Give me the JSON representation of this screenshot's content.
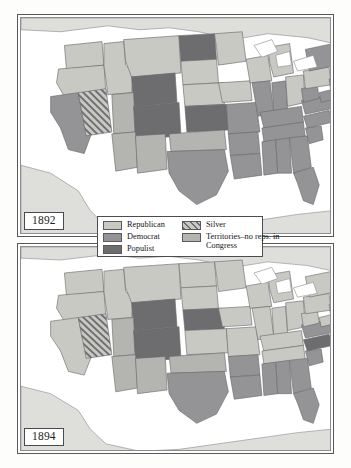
{
  "figure": {
    "kind": "two-panel-choropleth-map",
    "region": "United States"
  },
  "panels": [
    {
      "id": "panel-1892",
      "year_label": "1892"
    },
    {
      "id": "panel-1894",
      "year_label": "1894"
    }
  ],
  "legend": {
    "left_column": [
      {
        "key": "republican",
        "label": "Republican",
        "color": "#c9c9c4",
        "pattern": "solid"
      },
      {
        "key": "democrat",
        "label": "Democrat",
        "color": "#949497",
        "pattern": "solid"
      },
      {
        "key": "populist",
        "label": "Populist",
        "color": "#6d6d70",
        "pattern": "solid"
      }
    ],
    "right_column": [
      {
        "key": "silver",
        "label": "Silver",
        "color": "#c9c9c4",
        "pattern": "diagonal-hatch"
      },
      {
        "key": "territories",
        "label": "Territories–no reps. in Congress",
        "color": "#b4b4b0",
        "pattern": "solid"
      }
    ]
  },
  "colors": {
    "republican": "#c9c9c4",
    "democrat": "#949497",
    "populist": "#6d6d70",
    "silver_base": "#c9c9c4",
    "silver_stripe": "#6f6f72",
    "territory": "#b4b4b0",
    "water": "#ffffff",
    "outside_land": "#dededa",
    "state_outline": "#6a6a6d",
    "coast_outline": "#87878a",
    "frame": "#58585a",
    "page": "#fdfdfc"
  },
  "map_geometry": {
    "note": "Simplified state polygons in a 317x223 panel coordinate space.",
    "outside_land": [
      "M 0,0 L 317,0 L 317,26 L 290,20 L 250,16 L 215,22 L 180,14 L 150,10 L 120,12 L 88,8 L 40,14 L 0,12 Z",
      "M 0,150 L 30,158 L 58,176 L 70,196 L 86,212 L 120,220 L 160,218 L 200,212 L 240,206 L 280,200 L 317,196 L 317,223 L 0,223 Z"
    ],
    "states": [
      {
        "n": "WA",
        "d": "M 44,28 L 82,24 L 84,48 L 46,52 Z"
      },
      {
        "n": "OR",
        "d": "M 38,52 L 84,48 L 86,76 L 44,80 L 36,66 Z"
      },
      {
        "n": "CA",
        "d": "M 30,80 L 58,76 L 62,98 L 72,116 L 64,138 L 48,134 L 40,112 L 30,96 Z"
      },
      {
        "n": "NV",
        "d": "M 58,76 L 86,72 L 92,116 L 66,120 Z"
      },
      {
        "n": "ID",
        "d": "M 84,26 L 104,24 L 106,48 L 114,56 L 112,76 L 88,78 L 84,48 Z"
      },
      {
        "n": "MT",
        "d": "M 104,22 L 160,18 L 162,56 L 112,60 L 106,44 Z"
      },
      {
        "n": "WY",
        "d": "M 112,60 L 156,56 L 158,86 L 114,90 Z"
      },
      {
        "n": "UT",
        "d": "M 92,78 L 114,76 L 116,116 L 94,118 Z"
      },
      {
        "n": "CO",
        "d": "M 114,90 L 160,86 L 162,120 L 116,124 Z"
      },
      {
        "n": "AZ",
        "d": "M 92,118 L 116,116 L 118,152 L 96,156 Z"
      },
      {
        "n": "NM",
        "d": "M 116,120 L 146,118 L 148,154 L 118,158 Z"
      },
      {
        "n": "ND",
        "d": "M 160,18 L 196,16 L 198,42 L 162,44 Z"
      },
      {
        "n": "SD",
        "d": "M 162,44 L 198,42 L 200,66 L 164,68 Z"
      },
      {
        "n": "NE",
        "d": "M 164,68 L 204,66 L 206,88 L 166,90 Z"
      },
      {
        "n": "KS",
        "d": "M 166,90 L 208,88 L 210,114 L 168,116 Z"
      },
      {
        "n": "OK",
        "d": "M 150,118 L 206,114 L 208,134 L 152,136 Z"
      },
      {
        "n": "TX",
        "d": "M 148,136 L 206,134 L 210,156 L 198,180 L 178,190 L 160,176 L 150,158 Z"
      },
      {
        "n": "MN",
        "d": "M 196,16 L 224,14 L 228,44 L 200,48 L 198,30 Z"
      },
      {
        "n": "IA",
        "d": "M 200,66 L 232,64 L 234,84 L 204,86 Z"
      },
      {
        "n": "MO",
        "d": "M 208,88 L 238,86 L 242,116 L 210,118 Z"
      },
      {
        "n": "AR",
        "d": "M 210,118 L 240,116 L 242,138 L 212,140 Z"
      },
      {
        "n": "LA",
        "d": "M 212,140 L 242,138 L 244,160 L 216,164 Z"
      },
      {
        "n": "WI",
        "d": "M 228,42 L 250,38 L 254,64 L 232,66 Z"
      },
      {
        "n": "IL",
        "d": "M 234,66 L 252,64 L 256,96 L 240,100 Z"
      },
      {
        "n": "MI",
        "d": "M 250,30 L 272,26 L 276,56 L 256,60 L 252,46 Z"
      },
      {
        "n": "IN",
        "d": "M 254,66 L 268,64 L 270,94 L 256,96 Z"
      },
      {
        "n": "OH",
        "d": "M 268,60 L 286,58 L 288,86 L 270,90 Z"
      },
      {
        "n": "KY",
        "d": "M 242,96 L 284,90 L 286,106 L 246,112 Z"
      },
      {
        "n": "TN",
        "d": "M 244,112 L 286,106 L 288,122 L 246,126 Z"
      },
      {
        "n": "MS",
        "d": "M 244,126 L 258,124 L 260,158 L 246,160 Z"
      },
      {
        "n": "AL",
        "d": "M 258,124 L 272,122 L 274,158 L 260,158 Z"
      },
      {
        "n": "GA",
        "d": "M 272,122 L 290,120 L 294,152 L 276,158 Z"
      },
      {
        "n": "FL",
        "d": "M 276,158 L 296,152 L 302,170 L 296,190 L 286,186 L 280,168 Z"
      },
      {
        "n": "SC",
        "d": "M 288,112 L 304,110 L 306,124 L 292,128 Z"
      },
      {
        "n": "NC",
        "d": "M 286,100 L 312,94 L 316,106 L 290,112 Z"
      },
      {
        "n": "VA",
        "d": "M 284,84 L 312,78 L 316,92 L 288,98 Z"
      },
      {
        "n": "WV",
        "d": "M 284,72 L 300,68 L 302,82 L 286,86 Z"
      },
      {
        "n": "PA",
        "d": "M 286,54 L 312,50 L 314,68 L 288,72 Z"
      },
      {
        "n": "NY",
        "d": "M 288,32 L 316,26 L 320,48 L 292,54 Z"
      },
      {
        "n": "NJ",
        "d": "M 312,62 L 320,60 L 322,74 L 314,76 Z"
      },
      {
        "n": "MD",
        "d": "M 302,76 L 318,72 L 320,82 L 304,86 Z"
      },
      {
        "n": "NEW-ENGLAND",
        "d": "M 314,24 L 334,18 L 338,42 L 318,48 Z"
      }
    ],
    "lakes": [
      "M 236,28 L 254,22 L 260,34 L 244,40 Z",
      "M 258,38 L 272,34 L 274,48 L 260,50 Z",
      "M 276,44 L 296,38 L 300,50 L 280,54 Z"
    ]
  },
  "chart_data": {
    "type": "choropleth",
    "panels": [
      {
        "year": "1892",
        "categories": [
          "Republican",
          "Democrat",
          "Populist",
          "Silver",
          "Territories–no reps. in Congress"
        ],
        "assignments": {
          "WA": "republican",
          "OR": "republican",
          "CA": "democrat",
          "NV": "silver",
          "ID": "republican",
          "MT": "republican",
          "WY": "populist",
          "UT": "territory",
          "CO": "populist",
          "AZ": "territory",
          "NM": "territory",
          "ND": "populist",
          "SD": "republican",
          "NE": "republican",
          "KS": "populist",
          "OK": "territory",
          "TX": "democrat",
          "MN": "republican",
          "IA": "republican",
          "MO": "democrat",
          "AR": "democrat",
          "LA": "democrat",
          "WI": "republican",
          "IL": "democrat",
          "MI": "republican",
          "IN": "democrat",
          "OH": "republican",
          "KY": "democrat",
          "TN": "democrat",
          "MS": "democrat",
          "AL": "democrat",
          "GA": "democrat",
          "FL": "democrat",
          "SC": "democrat",
          "NC": "democrat",
          "VA": "democrat",
          "WV": "democrat",
          "PA": "republican",
          "NY": "democrat",
          "NJ": "democrat",
          "MD": "democrat",
          "NEW-ENGLAND": "republican"
        }
      },
      {
        "year": "1894",
        "categories": [
          "Republican",
          "Democrat",
          "Populist",
          "Silver",
          "Territories–no reps. in Congress"
        ],
        "assignments": {
          "WA": "republican",
          "OR": "republican",
          "CA": "republican",
          "NV": "silver",
          "ID": "republican",
          "MT": "republican",
          "WY": "populist",
          "UT": "territory",
          "CO": "populist",
          "AZ": "territory",
          "NM": "territory",
          "ND": "republican",
          "SD": "republican",
          "NE": "populist",
          "KS": "republican",
          "OK": "territory",
          "TX": "democrat",
          "MN": "republican",
          "IA": "republican",
          "MO": "republican",
          "AR": "democrat",
          "LA": "democrat",
          "WI": "republican",
          "IL": "republican",
          "MI": "republican",
          "IN": "republican",
          "OH": "republican",
          "KY": "republican",
          "TN": "republican",
          "MS": "democrat",
          "AL": "democrat",
          "GA": "democrat",
          "FL": "democrat",
          "SC": "democrat",
          "NC": "populist",
          "VA": "democrat",
          "WV": "republican",
          "PA": "republican",
          "NY": "republican",
          "NJ": "republican",
          "MD": "republican",
          "NEW-ENGLAND": "republican"
        }
      }
    ]
  }
}
